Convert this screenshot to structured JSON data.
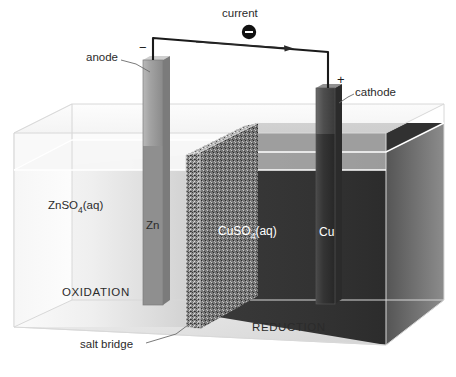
{
  "figure": {
    "background_color": "#ffffff"
  },
  "circuit": {
    "current_label": "current",
    "electron_symbol": "−",
    "anode_label": "anode",
    "cathode_label": "cathode",
    "anode_sign": "−",
    "cathode_sign": "+",
    "wire_color": "#1a1a1a"
  },
  "half_cells": {
    "left": {
      "solution_formula": "ZnSO",
      "solution_subscript": "4",
      "solution_state": "(aq)",
      "electrode_label": "Zn",
      "process_label": "OXIDATION",
      "solution_color": "#e9e9e9",
      "electrode_color": "#9a9a9a",
      "text_color": "#2b2b2b"
    },
    "right": {
      "solution_formula": "CuSO",
      "solution_subscript": "4",
      "solution_state": "(aq)",
      "electrode_label": "Cu",
      "process_label": "REDUCTION",
      "solution_color": "#3c3c3c",
      "electrode_color": "#4a4a4a",
      "text_color": "#ffffff"
    }
  },
  "salt_bridge": {
    "label": "salt bridge",
    "color": "#9f9f9f"
  },
  "tank": {
    "glass_color": "#f2f2f2",
    "floor_color": "#e4e4e4",
    "edge_color": "#d8d8d8"
  }
}
